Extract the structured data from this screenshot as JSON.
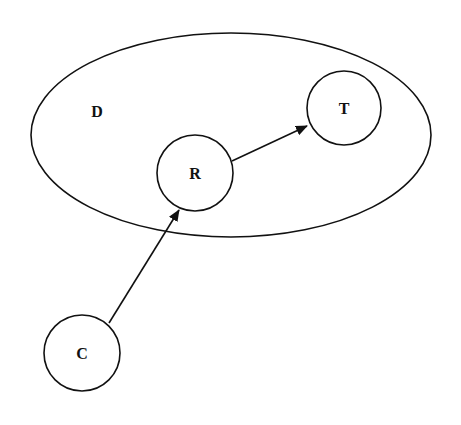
{
  "diagram": {
    "type": "directed-graph",
    "container": {
      "id": "D",
      "label": "D",
      "shape": "ellipse",
      "cx": 231,
      "cy": 135,
      "rx": 200,
      "ry": 102,
      "label_x": 97,
      "label_y": 117
    },
    "nodes": [
      {
        "id": "T",
        "label": "T",
        "shape": "circle",
        "cx": 344,
        "cy": 108,
        "r": 37,
        "inside": "D"
      },
      {
        "id": "R",
        "label": "R",
        "shape": "circle",
        "cx": 195,
        "cy": 173,
        "r": 38,
        "inside": "D"
      },
      {
        "id": "C",
        "label": "C",
        "shape": "circle",
        "cx": 82,
        "cy": 353,
        "r": 38,
        "inside": null
      }
    ],
    "edges": [
      {
        "from": "R",
        "to": "T",
        "x1": 232,
        "y1": 161,
        "x2": 307,
        "y2": 126
      },
      {
        "from": "C",
        "to": "R",
        "x1": 109,
        "y1": 323,
        "x2": 179,
        "y2": 210
      }
    ],
    "colors": {
      "stroke": "#111111",
      "background": "#ffffff"
    }
  }
}
